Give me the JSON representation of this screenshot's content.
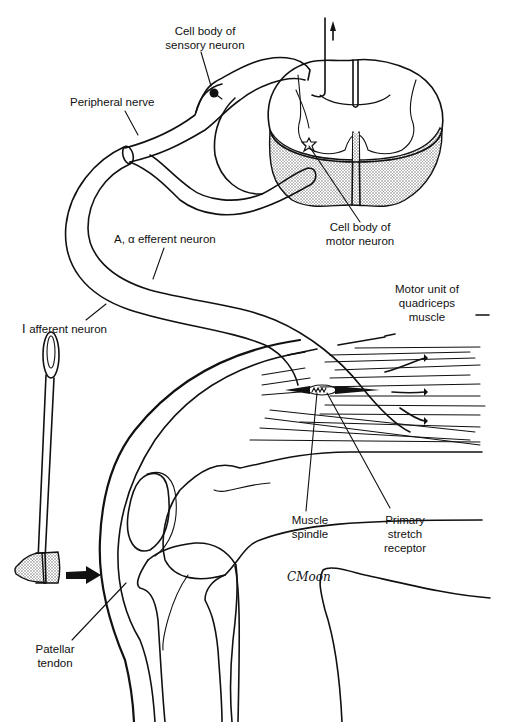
{
  "figure": {
    "colors": {
      "ink": "#111111",
      "background": "#ffffff",
      "stipple": "#8a8a8a"
    }
  },
  "labels": {
    "cell_body_sensory": [
      "Cell body of",
      "sensory neuron"
    ],
    "peripheral_nerve": "Peripheral nerve",
    "cell_body_motor": [
      "Cell body of",
      "motor neuron"
    ],
    "a_alpha_efferent": "A, α efferent neuron",
    "motor_unit": [
      "Motor unit of",
      "quadriceps",
      "muscle"
    ],
    "afferent": "Ⅰ afferent neuron",
    "muscle_spindle": [
      "Muscle",
      "spindle"
    ],
    "primary_stretch": [
      "Primary",
      "stretch",
      "receptor"
    ],
    "patellar_tendon": [
      "Patellar",
      "tendon"
    ],
    "signature": "CMoon"
  },
  "icons": {
    "ascending_arrow": "arrow-up-icon",
    "tap_arrow": "arrow-right-icon",
    "reflex_hammer": "reflex-hammer-icon"
  }
}
